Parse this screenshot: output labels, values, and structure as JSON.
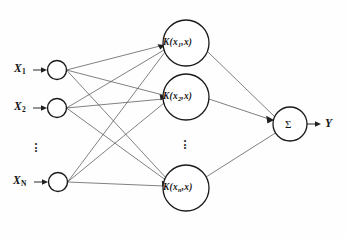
{
  "figure": {
    "type": "neural-network-diagram",
    "background_color": "#fefefe",
    "line_color": "#4a4a4a",
    "node_stroke_color": "#1a1a1a",
    "node_fill_color": "#ffffff"
  },
  "input_layer": {
    "name": "input-layer",
    "nodes": [
      {
        "label_base": "X",
        "label_sub": "1",
        "cx": 57,
        "cy": 70,
        "r": 9.5
      },
      {
        "label_base": "X",
        "label_sub": "2",
        "cx": 57,
        "cy": 108,
        "r": 9.5
      },
      {
        "label_base": "X",
        "label_sub": "N",
        "cx": 58,
        "cy": 182,
        "r": 9.5
      }
    ],
    "ellipsis": "⋮"
  },
  "kernel_layer": {
    "name": "kernel-layer",
    "nodes": [
      {
        "fn": "K",
        "open": "(",
        "arg_base": "x",
        "arg_sub": "1",
        "sep": ",",
        "arg2": "x",
        "close": ")",
        "cx": 186,
        "cy": 43,
        "r": 23
      },
      {
        "fn": "K",
        "open": "(",
        "arg_base": "x",
        "arg_sub": "2",
        "sep": ",",
        "arg2": "x",
        "close": ")",
        "cx": 186,
        "cy": 97,
        "r": 23
      },
      {
        "fn": "K",
        "open": "(",
        "arg_base": "x",
        "arg_sub": "n",
        "sep": ",",
        "arg2": "x",
        "close": ")",
        "cx": 186,
        "cy": 188,
        "r": 23
      }
    ],
    "ellipsis": "⋮"
  },
  "output_layer": {
    "name": "output-layer",
    "summation_node": {
      "symbol": "Σ",
      "cx": 290,
      "cy": 124,
      "r": 17
    },
    "output_label": "Y"
  },
  "connections": {
    "input_to_kernel": "fully-connected",
    "kernel_to_output": "summation"
  }
}
